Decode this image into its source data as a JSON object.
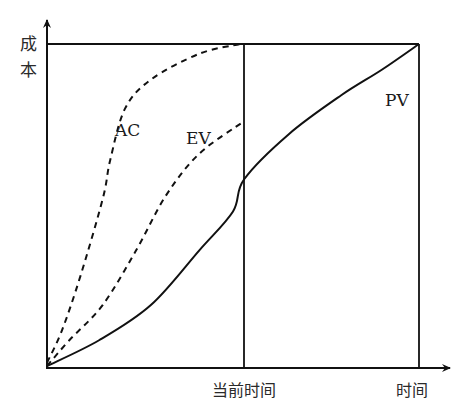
{
  "chart_data": {
    "type": "line",
    "title": "",
    "xlabel": "时间",
    "ylabel": "成本",
    "x_markers": [
      {
        "label": "当前时间",
        "x": 0.53
      },
      {
        "label": "时间",
        "x": 1.0
      }
    ],
    "xlim": [
      0,
      1.0
    ],
    "ylim": [
      0,
      1.0
    ],
    "grid": false,
    "legend": "inline labels",
    "series": [
      {
        "name": "AC",
        "style": "dashed",
        "x": [
          0,
          0.04,
          0.09,
          0.15,
          0.17,
          0.21,
          0.28,
          0.41,
          0.52
        ],
        "y": [
          0.01,
          0.11,
          0.28,
          0.52,
          0.64,
          0.8,
          0.89,
          0.97,
          1.0
        ]
      },
      {
        "name": "EV",
        "style": "dashed",
        "x": [
          0,
          0.06,
          0.15,
          0.24,
          0.32,
          0.41,
          0.53
        ],
        "y": [
          0.0,
          0.08,
          0.19,
          0.36,
          0.53,
          0.66,
          0.76
        ]
      },
      {
        "name": "PV",
        "style": "solid",
        "x": [
          0,
          0.14,
          0.28,
          0.41,
          0.5,
          0.53,
          0.65,
          0.79,
          0.9,
          1.0
        ],
        "y": [
          0.0,
          0.08,
          0.19,
          0.36,
          0.48,
          0.58,
          0.72,
          0.84,
          0.92,
          1.0
        ]
      }
    ]
  },
  "labels": {
    "y_axis_line1": "成",
    "y_axis_line2": "本",
    "current_time": "当前时间",
    "time": "时间",
    "ac": "AC",
    "ev": "EV",
    "pv": "PV"
  }
}
